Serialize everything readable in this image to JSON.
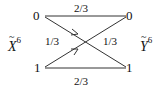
{
  "diagram": {
    "type": "channel-transition-diagram",
    "input_variable": {
      "symbol": "X",
      "superscript": "6",
      "accent": "~"
    },
    "output_variable": {
      "symbol": "Y",
      "superscript": "6",
      "accent": "~"
    },
    "input_nodes": [
      "0",
      "1"
    ],
    "output_nodes": [
      "0",
      "1"
    ],
    "edges": [
      {
        "from": "0",
        "to": "0",
        "prob": "2/3"
      },
      {
        "from": "0",
        "to": "1",
        "prob": "1/3"
      },
      {
        "from": "1",
        "to": "0",
        "prob": "1/3"
      },
      {
        "from": "1",
        "to": "1",
        "prob": "2/3"
      }
    ],
    "colors": {
      "line": "#333333",
      "text": "#111111"
    }
  }
}
